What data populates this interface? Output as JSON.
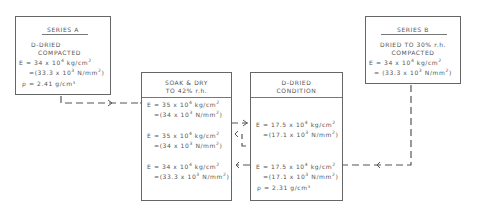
{
  "series_a": {
    "title": "SERIES A",
    "line1": "D-DRIED",
    "line2": "COMPACTED",
    "e_kg": "E = 34 x 10",
    "e_kg_exp": "4",
    "e_kg_unit": " kg/cm",
    "e_kg_unit_exp": "2",
    "e_n": "=(33.3 x 10",
    "e_n_exp": "3",
    "e_n_unit": " N/mm",
    "e_n_unit_exp": "2",
    "e_n_close": ")",
    "rho": "ρ = 2.41 g/cm³"
  },
  "series_b": {
    "title": "SERIES B",
    "line1": "DRIED TO 30% r.h.",
    "line2": "COMPACTED",
    "e_kg": "E = 34 x 10",
    "e_kg_exp": "4",
    "e_kg_unit": " kg/cm",
    "e_kg_unit_exp": "2",
    "e_n": "= (33.3 x 10",
    "e_n_exp": "3",
    "e_n_unit": " N/mm",
    "e_n_unit_exp": "2",
    "e_n_close": ")"
  },
  "soak_dry": {
    "title1": "SOAK & DRY",
    "title2": "TO 42% r.h.",
    "entries": [
      {
        "e_kg": "E = 35 x 10",
        "exp": "4",
        "unit": " kg/cm",
        "unit_exp": "2",
        "e_n": "=(34 x 10",
        "n_exp": "3",
        "n_unit": " N/mm",
        "n_unit_exp": "2",
        "close": ")"
      },
      {
        "e_kg": "E = 35 x 10",
        "exp": "4",
        "unit": " kg/cm",
        "unit_exp": "2",
        "e_n": "=(34 x 10",
        "n_exp": "3",
        "n_unit": " N/mm",
        "n_unit_exp": "2",
        "close": ")"
      },
      {
        "e_kg": "E = 34 x 10",
        "exp": "4",
        "unit": " kg/cm",
        "unit_exp": "2",
        "e_n": "=(33.3 x 10",
        "n_exp": "3",
        "n_unit": " N/mm",
        "n_unit_exp": "2",
        "close": ")"
      }
    ]
  },
  "d_dried": {
    "title1": "D-DRIED",
    "title2": "CONDITION",
    "entries": [
      {
        "e_kg": "E = 17.5 x 10",
        "exp": "4",
        "unit": " kg/cm",
        "unit_exp": "2",
        "e_n": "=(17.1 x 10",
        "n_exp": "3",
        "n_unit": " N/mm",
        "n_unit_exp": "2",
        "close": ")"
      },
      {
        "e_kg": "E = 17.5 x 10",
        "exp": "4",
        "unit": " kg/cm",
        "unit_exp": "2",
        "e_n": "=(17.1 x 10",
        "n_exp": "3",
        "n_unit": " N/mm",
        "n_unit_exp": "2",
        "close": ")"
      }
    ],
    "rho": "ρ = 2.31 g/cm³"
  },
  "colors": {
    "line": "#555555",
    "border": "#666666",
    "text": "#555555"
  }
}
